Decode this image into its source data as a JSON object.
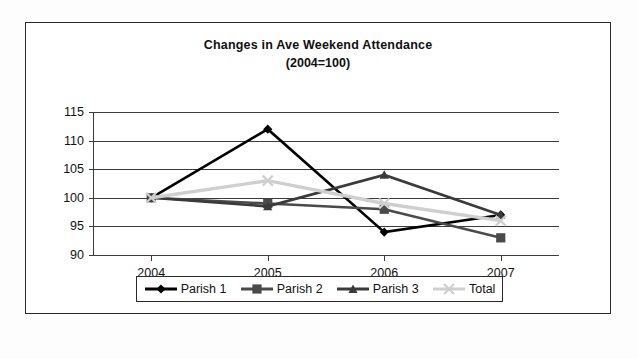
{
  "chart_data": {
    "type": "line",
    "title": "Changes in Ave Weekend Attendance",
    "subtitle": "(2004=100)",
    "xlabel": "",
    "ylabel": "",
    "categories": [
      "2004",
      "2005",
      "2006",
      "2007"
    ],
    "ylim": [
      90,
      115
    ],
    "yticks": [
      90,
      95,
      100,
      105,
      110,
      115
    ],
    "grid": true,
    "legend_position": "bottom",
    "series": [
      {
        "name": "Parish 1",
        "marker": "diamond",
        "color": "#000000",
        "values": [
          100,
          112,
          94,
          97
        ]
      },
      {
        "name": "Parish 2",
        "marker": "square",
        "color": "#4a4a4a",
        "values": [
          100,
          99,
          98,
          93
        ]
      },
      {
        "name": "Parish 3",
        "marker": "triangle",
        "color": "#3a3a3a",
        "values": [
          100,
          98.5,
          104,
          97
        ]
      },
      {
        "name": "Total",
        "marker": "x",
        "color": "#cfcfcf",
        "values": [
          100,
          103,
          99,
          96
        ]
      }
    ]
  },
  "legend": {
    "items": [
      {
        "label": "Parish 1",
        "marker": "diamond-marker-icon",
        "color": "#000000"
      },
      {
        "label": "Parish 2",
        "marker": "square-marker-icon",
        "color": "#4a4a4a"
      },
      {
        "label": "Parish 3",
        "marker": "triangle-marker-icon",
        "color": "#3a3a3a"
      },
      {
        "label": "Total",
        "marker": "x-marker-icon",
        "color": "#cfcfcf"
      }
    ]
  }
}
